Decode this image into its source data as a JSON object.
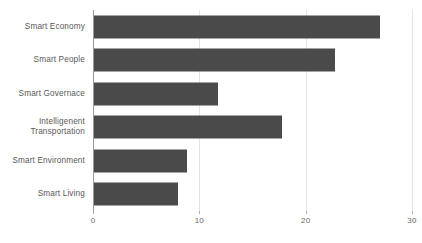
{
  "chart_data": {
    "type": "bar",
    "orientation": "horizontal",
    "title": "",
    "subtitle": "",
    "xlabel": "",
    "ylabel": "",
    "xlim": [
      0,
      30
    ],
    "xticks": [
      0,
      10,
      20,
      30
    ],
    "xtick_labels": [
      "0",
      "10",
      "20",
      "30"
    ],
    "grid": "vertical-light",
    "legend": "none",
    "bar_color": "#4a4a4a",
    "axis_color": "#9a9a9a",
    "grid_color": "#e4e4e4",
    "label_color": "#595959",
    "tick_label_color": "#686868",
    "background": "#ffffff",
    "categories": [
      "Smart Economy",
      "Smart People",
      "Smart Governace",
      "Intelligenent\nTransportation",
      "Smart Environment",
      "Smart Living"
    ],
    "values": [
      27,
      22.8,
      11.8,
      17.8,
      8.8,
      8
    ]
  }
}
